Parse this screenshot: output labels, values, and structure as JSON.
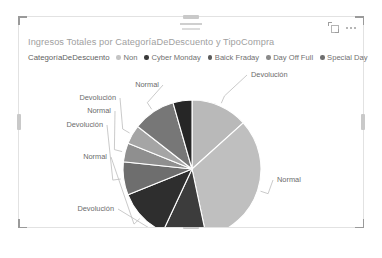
{
  "visual": {
    "title": "Ingresos Totales por CategoríaDeDescuento y TipoCompra",
    "actions": {
      "focus_label": "focus-mode",
      "more_label": "more-options"
    },
    "handles": {
      "top": "drag-handle-top",
      "bottom": "drag-handle-bottom",
      "left": "resize-handle-left",
      "right": "resize-handle-right"
    }
  },
  "legend": {
    "title": "CategoríaDeDescuento",
    "items": [
      {
        "label": "Non",
        "color": "#c4c4c4"
      },
      {
        "label": "Cyber Monday",
        "color": "#3a3a3a"
      },
      {
        "label": "Baick Fraday",
        "color": "#5a5a5a"
      },
      {
        "label": "Day Off Full",
        "color": "#8a8a8a"
      },
      {
        "label": "Special Day",
        "color": "#6f6f6f"
      }
    ]
  },
  "chart_data": {
    "type": "pie",
    "title": "Ingresos Totales por CategoríaDeDescuento y TipoCompra",
    "legend_title": "CategoríaDeDescuento",
    "legend_position": "top",
    "grid": false,
    "categories": [
      "Non / Normal",
      "Non / Devolución",
      "Cyber Monday / Normal",
      "Cyber Monday / Devolución",
      "Baick Fraday / Normal",
      "Baick Fraday / Devolución",
      "Day Off Full / Normal",
      "Day Off Full / Devolución",
      "Special Day / Normal"
    ],
    "labels": [
      "Devolución",
      "Normal",
      "Devolución",
      "Normal",
      "Devolución",
      "Normal",
      "Normal",
      "Devolución",
      "Normal"
    ],
    "values": [
      14,
      22,
      12,
      3,
      4,
      5,
      6,
      9,
      25
    ],
    "colors": [
      "#b8b8b8",
      "#bdbdbd",
      "#c2c2c2",
      "#2f2f2f",
      "#4a4a4a",
      "#3a3a3a",
      "#7e7e7e",
      "#8d8d8d",
      "#9a9a9a"
    ],
    "slices": [
      {
        "label": "Devolución",
        "start": 0,
        "end": 48,
        "color": "#b9b9b9",
        "lx": 232,
        "ly": 12,
        "anchor": "start"
      },
      {
        "label": "Normal",
        "start": 48,
        "end": 168,
        "color": "#bfbfbf",
        "lx": 258,
        "ly": 117,
        "anchor": "start"
      },
      {
        "label": "Devolución",
        "start": 168,
        "end": 205,
        "color": "#3c3c3c",
        "lx": 95,
        "ly": 146,
        "anchor": "end"
      },
      {
        "label": "Normal",
        "start": 205,
        "end": 248,
        "color": "#2e2e2e",
        "lx": 88,
        "ly": 94,
        "anchor": "end"
      },
      {
        "label": "Devolución",
        "start": 248,
        "end": 276,
        "color": "#6e6e6e",
        "lx": 84,
        "ly": 62,
        "anchor": "end"
      },
      {
        "label": "Normal",
        "start": 276,
        "end": 292,
        "color": "#8f8f8f",
        "lx": 92,
        "ly": 48,
        "anchor": "end"
      },
      {
        "label": "Devolución",
        "start": 292,
        "end": 308,
        "color": "#a5a5a5",
        "lx": 97,
        "ly": 35,
        "anchor": "end"
      },
      {
        "label": "Normal",
        "start": 308,
        "end": 344,
        "color": "#777777",
        "lx": 140,
        "ly": 22,
        "anchor": "end"
      },
      {
        "label": "Normal",
        "start": 344,
        "end": 360,
        "color": "#262626",
        "lx": 140,
        "ly": 22,
        "anchor": "end",
        "hide_label": true
      }
    ]
  }
}
